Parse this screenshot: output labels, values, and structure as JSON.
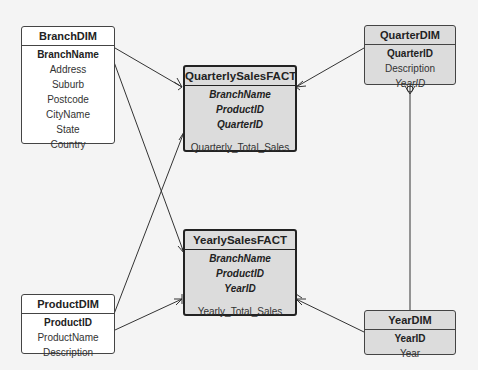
{
  "colors": {
    "background": "#f4f4f4",
    "dim_white": "#ffffff",
    "table_grey": "#dcdcdc",
    "line": "#333333"
  },
  "entities": {
    "branch_dim": {
      "title": "BranchDIM",
      "attributes": [
        {
          "name": "BranchName",
          "key": "pk"
        },
        {
          "name": "Address",
          "key": ""
        },
        {
          "name": "Suburb",
          "key": ""
        },
        {
          "name": "Postcode",
          "key": ""
        },
        {
          "name": "CityName",
          "key": ""
        },
        {
          "name": "State",
          "key": ""
        },
        {
          "name": "Country",
          "key": ""
        }
      ]
    },
    "product_dim": {
      "title": "ProductDIM",
      "attributes": [
        {
          "name": "ProductID",
          "key": "pk"
        },
        {
          "name": "ProductName",
          "key": ""
        },
        {
          "name": "Description",
          "key": ""
        }
      ]
    },
    "quarter_dim": {
      "title": "QuarterDIM",
      "attributes": [
        {
          "name": "QuarterID",
          "key": "pk"
        },
        {
          "name": "Description",
          "key": ""
        },
        {
          "name": "YearID",
          "key": "fk"
        }
      ]
    },
    "year_dim": {
      "title": "YearDIM",
      "attributes": [
        {
          "name": "YearID",
          "key": "pk"
        },
        {
          "name": "Year",
          "key": ""
        }
      ]
    },
    "quarterly_sales_fact": {
      "title": "QuarterlySalesFACT",
      "attributes": [
        {
          "name": "BranchName",
          "key": "pkfk"
        },
        {
          "name": "ProductID",
          "key": "pkfk"
        },
        {
          "name": "QuarterID",
          "key": "pkfk"
        },
        {
          "name": "Quarterly_Total_Sales",
          "key": ""
        }
      ]
    },
    "yearly_sales_fact": {
      "title": "YearlySalesFACT",
      "attributes": [
        {
          "name": "BranchName",
          "key": "pkfk"
        },
        {
          "name": "ProductID",
          "key": "pkfk"
        },
        {
          "name": "YearID",
          "key": "pkfk"
        },
        {
          "name": "Yearly_Total_Sales",
          "key": ""
        }
      ]
    }
  },
  "relationships": [
    {
      "from": "BranchDIM",
      "to": "QuarterlySalesFACT",
      "cardinality": "one-to-many"
    },
    {
      "from": "BranchDIM",
      "to": "YearlySalesFACT",
      "cardinality": "one-to-many"
    },
    {
      "from": "ProductDIM",
      "to": "QuarterlySalesFACT",
      "cardinality": "one-to-many"
    },
    {
      "from": "ProductDIM",
      "to": "YearlySalesFACT",
      "cardinality": "one-to-many"
    },
    {
      "from": "QuarterDIM",
      "to": "QuarterlySalesFACT",
      "cardinality": "one-to-many"
    },
    {
      "from": "YearDIM",
      "to": "QuarterDIM",
      "cardinality": "one-to-many"
    },
    {
      "from": "YearDIM",
      "to": "YearlySalesFACT",
      "cardinality": "one-to-many"
    }
  ]
}
